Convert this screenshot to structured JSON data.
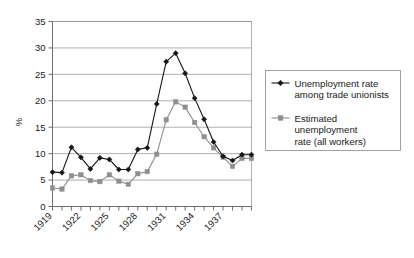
{
  "chart_data": {
    "type": "line",
    "title": "",
    "xlabel": "",
    "ylabel": "%",
    "ylim": [
      0,
      35
    ],
    "ytick_step": 5,
    "yticks": [
      "0",
      "5",
      "10",
      "15",
      "20",
      "25",
      "30",
      "35"
    ],
    "xticks_labeled": [
      "1919",
      "1922",
      "1925",
      "1928",
      "1931",
      "1934",
      "1937"
    ],
    "x": [
      1919,
      1920,
      1921,
      1922,
      1923,
      1924,
      1925,
      1926,
      1927,
      1928,
      1929,
      1930,
      1931,
      1932,
      1933,
      1934,
      1935,
      1936,
      1937,
      1938,
      1939,
      1940
    ],
    "grid": "horizontal",
    "legend_position": "right",
    "series": [
      {
        "name": "Unemployment rate among trade unionists",
        "marker": "diamond",
        "color": "#161616",
        "values": [
          6.5,
          6.4,
          11.2,
          9.3,
          7.1,
          9.2,
          8.9,
          7.0,
          7.0,
          10.8,
          11.1,
          19.4,
          27.4,
          29.0,
          25.2,
          20.5,
          16.5,
          12.2,
          9.5,
          8.7,
          9.8,
          9.8
        ]
      },
      {
        "name": "Estimated unemployment rate (all workers)",
        "marker": "square",
        "color": "#8f8f8f",
        "values": [
          3.5,
          3.3,
          5.8,
          6.0,
          4.9,
          4.7,
          6.0,
          4.8,
          4.2,
          6.2,
          6.6,
          9.9,
          16.4,
          19.8,
          18.8,
          15.9,
          13.2,
          11.1,
          9.3,
          7.6,
          9.1,
          9.1
        ]
      }
    ]
  },
  "legend": {
    "entries": [
      {
        "line1": "Unemployment rate",
        "line2": "among trade unionists",
        "line3": ""
      },
      {
        "line1": "Estimated",
        "line2": "unemployment",
        "line3": "rate (all workers)"
      }
    ]
  },
  "colors": {
    "series1": "#161616",
    "series2": "#8f8f8f",
    "grid": "#8c8c8c",
    "axis": "#6e6e6e",
    "background": "#ffffff"
  }
}
